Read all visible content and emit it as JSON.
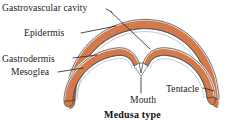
{
  "figure": {
    "caption": "Medusa type",
    "organism_type": "medusa",
    "colors": {
      "mesoglea_fill": "#d4794a",
      "outline": "#3b3b3b",
      "leader_line": "#1f1f1f",
      "text": "#1a1a1a",
      "background": "#ffffff",
      "epidermis_stipple": "#8a8a8a",
      "gastrodermis_line": "#5a5a5a"
    },
    "labels": [
      {
        "id": "gastrovascular-cavity",
        "text": "Gastrovascular cavity"
      },
      {
        "id": "epidermis",
        "text": "Epidermis"
      },
      {
        "id": "gastrodermis",
        "text": "Gastrodermis"
      },
      {
        "id": "mesoglea",
        "text": "Mesoglea"
      },
      {
        "id": "mouth",
        "text": "Mouth"
      },
      {
        "id": "tentacle",
        "text": "Tentacle"
      }
    ]
  }
}
